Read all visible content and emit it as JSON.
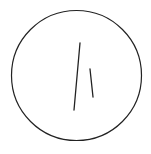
{
  "diagram": {
    "type": "clock-face",
    "background": "#ffffff",
    "stroke_color": "#222222",
    "circle": {
      "cx": 76.5,
      "cy": 75.5,
      "r": 65,
      "stroke_width": 1.2
    },
    "hands": [
      {
        "name": "minute-hand",
        "x1": 80,
        "y1": 43,
        "x2": 74,
        "y2": 110,
        "stroke_width": 1.3
      },
      {
        "name": "hour-hand",
        "x1": 90,
        "y1": 69,
        "x2": 93,
        "y2": 97,
        "stroke_width": 1.3
      }
    ]
  }
}
